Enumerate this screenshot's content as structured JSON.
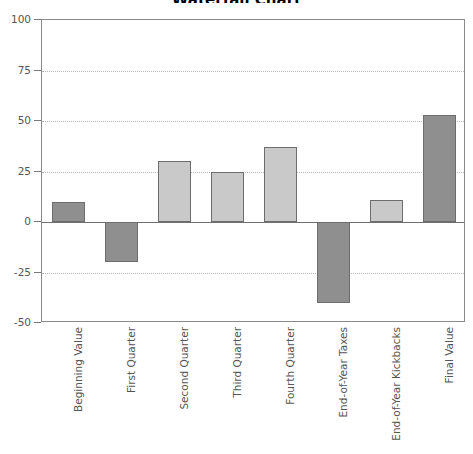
{
  "chart_data": {
    "type": "bar",
    "title": "Waterfall Chart",
    "xlabel": "",
    "ylabel": "",
    "ylim": [
      -50,
      100
    ],
    "yticks": [
      100,
      75,
      50,
      25,
      0,
      -25,
      -50
    ],
    "ytick_labels": [
      "100",
      "75",
      "50",
      "25",
      "0",
      "-25",
      "-50"
    ],
    "grid": true,
    "gridlines_at": [
      75,
      50,
      25,
      -25
    ],
    "zero_line": 0,
    "legend": "none",
    "categories": [
      "Beginning Value",
      "First Quarter",
      "Second Quarter",
      "Third Quarter",
      "Fourth Quarter",
      "End-of-Year Taxes",
      "End-of-Year Kickbacks",
      "Final Value"
    ],
    "values": [
      10,
      -20,
      30,
      25,
      37,
      -40,
      11,
      53
    ],
    "bar_colors": [
      "#8f8f8f",
      "#8f8f8f",
      "#c9c9c9",
      "#c9c9c9",
      "#c9c9c9",
      "#8f8f8f",
      "#c9c9c9",
      "#8f8f8f"
    ],
    "bar_edge_color": "#6d6d6d",
    "plot_border_color": "#8a8a8a",
    "gridline_color": "#b9b9b9",
    "text_color": "#555555",
    "background_color": "#ffffff"
  }
}
